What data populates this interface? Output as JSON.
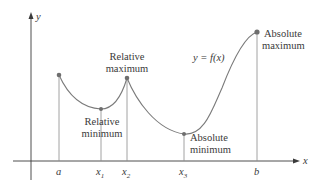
{
  "diagram": {
    "axes": {
      "x_label": "x",
      "y_label": "y"
    },
    "curve_label": "y = f(x)",
    "x_ticks": [
      {
        "id": "a",
        "label": "a",
        "sub": ""
      },
      {
        "id": "x1",
        "label": "x",
        "sub": "1"
      },
      {
        "id": "x2",
        "label": "x",
        "sub": "2"
      },
      {
        "id": "x3",
        "label": "x",
        "sub": "3"
      },
      {
        "id": "b",
        "label": "b",
        "sub": ""
      }
    ],
    "annotations": {
      "relative_max": [
        "Relative",
        "maximum"
      ],
      "relative_min": [
        "Relative",
        "minimum"
      ],
      "absolute_min": [
        "Absolute",
        "minimum"
      ],
      "absolute_max": [
        "Absolute",
        "maximum"
      ]
    },
    "points": [
      {
        "name": "a",
        "role": "endpoint"
      },
      {
        "name": "x1",
        "role": "Relative minimum"
      },
      {
        "name": "x2",
        "role": "Relative maximum"
      },
      {
        "name": "x3",
        "role": "Absolute minimum"
      },
      {
        "name": "b",
        "role": "Absolute maximum"
      }
    ],
    "colors": {
      "curve": "#7a7a7a",
      "axis": "#3a3a3a",
      "point": "#6e6e6e",
      "text": "#3a3a3a"
    }
  }
}
